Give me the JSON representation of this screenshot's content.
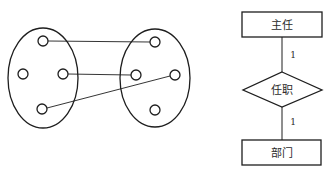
{
  "left_diagram": {
    "type": "mapping",
    "sets": [
      {
        "name": "left-set",
        "cx": 43,
        "cy": 78,
        "rx": 35,
        "ry": 50
      },
      {
        "name": "right-set",
        "cx": 155,
        "cy": 78,
        "rx": 35,
        "ry": 49
      }
    ],
    "elements": {
      "left": [
        {
          "id": "a1",
          "cx": 43,
          "cy": 41
        },
        {
          "id": "a2",
          "cx": 23,
          "cy": 74
        },
        {
          "id": "a3",
          "cx": 63,
          "cy": 74
        },
        {
          "id": "a4",
          "cx": 42,
          "cy": 109
        }
      ],
      "right": [
        {
          "id": "b1",
          "cx": 155,
          "cy": 42
        },
        {
          "id": "b2",
          "cx": 136,
          "cy": 75
        },
        {
          "id": "b3",
          "cx": 175,
          "cy": 75
        },
        {
          "id": "b4",
          "cx": 155,
          "cy": 110
        }
      ]
    },
    "mappings": [
      {
        "from": "a1",
        "to": "b1"
      },
      {
        "from": "a3",
        "to": "b2"
      },
      {
        "from": "a4",
        "to": "b3"
      }
    ]
  },
  "er_diagram": {
    "entity_top": {
      "label": "主任"
    },
    "relationship": {
      "label": "任职"
    },
    "entity_bottom": {
      "label": "部门"
    },
    "cardinality_top": "1",
    "cardinality_bottom": "1"
  }
}
